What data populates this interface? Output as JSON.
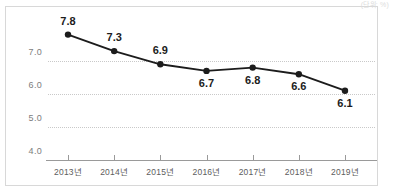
{
  "unit_note": "(단위: %)",
  "chart_data": {
    "type": "line",
    "title": "",
    "xlabel": "",
    "ylabel": "",
    "categories": [
      "2013년",
      "2014년",
      "2015년",
      "2016년",
      "2017년",
      "2018년",
      "2019년"
    ],
    "values": [
      7.8,
      7.3,
      6.9,
      6.7,
      6.8,
      6.6,
      6.1
    ],
    "point_labels": [
      "7.8",
      "7.3",
      "6.9",
      "6.7",
      "6.8",
      "6.6",
      "6.1"
    ],
    "ytick_labels": [
      "7.0",
      "6.0",
      "5.0",
      "4.0"
    ],
    "ytick_values": [
      7.0,
      6.0,
      5.0,
      4.0
    ],
    "ylim": [
      4.0,
      8.2
    ],
    "grid": true,
    "legend": false,
    "series_color": "#1c1c1c",
    "marker_color": "#1c1c1c",
    "gridline_color": "#c9c9c9",
    "axis_color": "#9a9a9a"
  }
}
